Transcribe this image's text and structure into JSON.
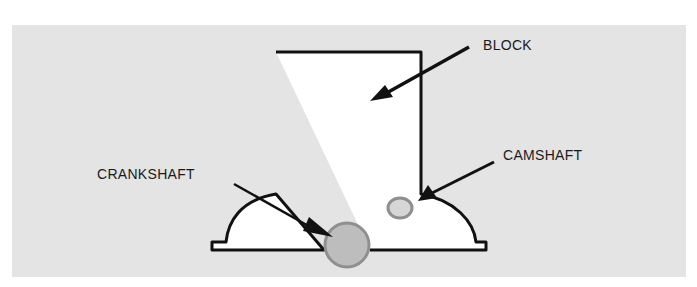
{
  "diagram": {
    "type": "engine-cross-section",
    "labels": {
      "block": "BLOCK",
      "crankshaft": "CRANKSHAFT",
      "camshaft": "CAMSHAFT"
    },
    "colors": {
      "panel_background": "#e4e4e4",
      "block_fill": "#ffffff",
      "outline": "#111111",
      "shaft_fill": "#bdbdbd",
      "shaft_stroke": "#8f8f8f"
    }
  }
}
